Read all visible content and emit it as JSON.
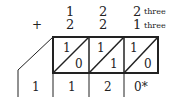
{
  "diagram": {
    "type": "lattice-addition",
    "base_label": "three",
    "operator": "+",
    "addend1": [
      "1",
      "2",
      "2"
    ],
    "addend2": [
      "2",
      "2",
      "1"
    ],
    "lattice_cells": [
      {
        "top": "1",
        "bottom": "0"
      },
      {
        "top": "1",
        "bottom": "1"
      },
      {
        "top": "1",
        "bottom": "0"
      }
    ],
    "result": [
      "1",
      "1",
      "2",
      "0*"
    ],
    "colors": {
      "line": "#222222",
      "text": "#222222",
      "background": "#ffffff"
    }
  }
}
